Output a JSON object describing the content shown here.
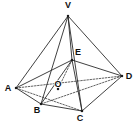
{
  "figure": {
    "kind": "geometry-diagram",
    "width": 137,
    "height": 125,
    "background_color": "#ffffff",
    "line_color": "#2b2b2b",
    "dashed_line_color": "#3a3a3a",
    "label_color": "#101010"
  },
  "points": {
    "V": {
      "label": "V",
      "x": 68,
      "y": 16,
      "label_x": 68,
      "label_y": 8
    },
    "A": {
      "label": "A",
      "x": 16,
      "y": 88,
      "label_x": 8,
      "label_y": 91
    },
    "B": {
      "label": "B",
      "x": 41,
      "y": 104,
      "label_x": 37,
      "label_y": 113
    },
    "C": {
      "label": "C",
      "x": 82,
      "y": 111,
      "label_x": 80,
      "label_y": 121
    },
    "D": {
      "label": "D",
      "x": 122,
      "y": 76,
      "label_x": 129,
      "label_y": 79
    },
    "E": {
      "label": "E",
      "x": 72,
      "y": 60,
      "label_x": 78,
      "label_y": 55
    },
    "O": {
      "label": "O",
      "x": 58,
      "y": 89,
      "label_x": 58,
      "label_y": 87
    }
  },
  "edges_solid": [
    {
      "name": "V-A",
      "from": "V",
      "to": "A"
    },
    {
      "name": "V-B",
      "from": "V",
      "to": "B"
    },
    {
      "name": "V-C",
      "from": "V",
      "to": "C"
    },
    {
      "name": "V-D",
      "from": "V",
      "to": "D"
    },
    {
      "name": "V-E",
      "from": "V",
      "to": "E"
    },
    {
      "name": "A-B",
      "from": "A",
      "to": "B"
    },
    {
      "name": "B-C",
      "from": "B",
      "to": "C"
    },
    {
      "name": "C-D",
      "from": "C",
      "to": "D"
    },
    {
      "name": "A-E",
      "from": "A",
      "to": "E"
    },
    {
      "name": "B-E",
      "from": "B",
      "to": "E"
    },
    {
      "name": "C-E",
      "from": "C",
      "to": "E"
    },
    {
      "name": "D-E",
      "from": "D",
      "to": "E"
    }
  ],
  "edges_dashed": [
    {
      "name": "A-O-D",
      "from": "A",
      "to": "D"
    },
    {
      "name": "B-O-D",
      "from": "B",
      "to": "D"
    },
    {
      "name": "E-O",
      "from": "E",
      "to": "O"
    },
    {
      "name": "A-C",
      "from": "A",
      "to": "C"
    }
  ],
  "vertex_order": [
    "V",
    "E",
    "A",
    "B",
    "C",
    "D",
    "O"
  ]
}
